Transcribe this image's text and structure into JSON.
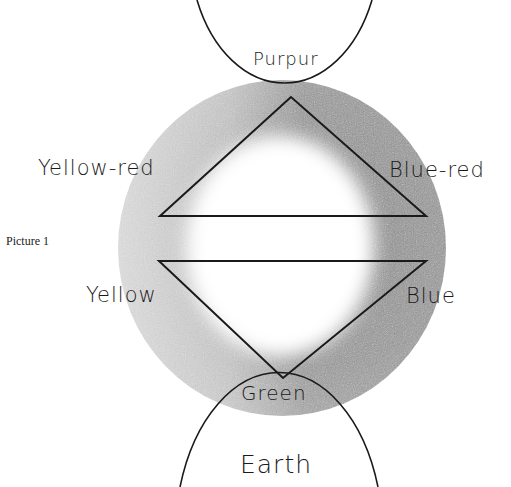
{
  "caption": "Picture 1",
  "labels": {
    "top": "Purpur",
    "upper_left": "Yellow-red",
    "upper_right": "Blue-red",
    "lower_left": "Yellow",
    "lower_right": "Blue",
    "bottom": "Green",
    "footer": "Earth"
  },
  "colors": {
    "ring_dark": "#8a8a8a",
    "ring_light": "#c8c8c8",
    "line": "#1a1a1a",
    "background": "#ffffff"
  }
}
